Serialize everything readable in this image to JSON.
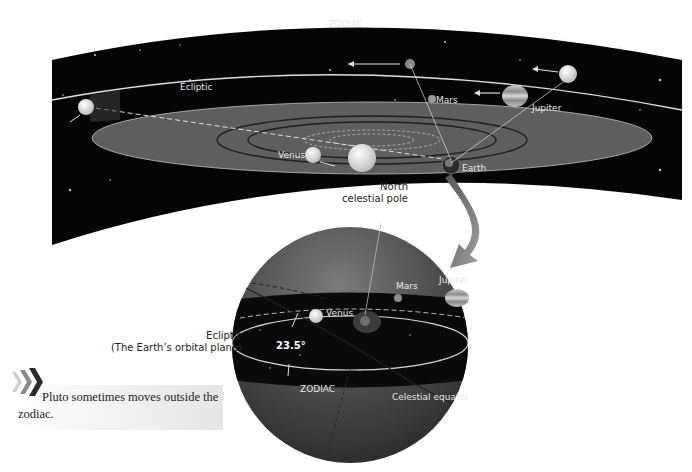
{
  "top_band": {
    "title": "ZODIAC",
    "ecliptic_label": "Ecliptic",
    "planets": {
      "mars": "Mars",
      "jupiter": "Jupiter",
      "venus": "Venus",
      "earth": "Earth"
    }
  },
  "pole_label": {
    "line1": "North",
    "line2": "celestial pole"
  },
  "sphere": {
    "mars": "Mars",
    "jupiter": "Jupiter",
    "venus": "Venus",
    "angle": "23.5°",
    "zodiac": "ZODIAC",
    "celestial_equator": "Celestial equator"
  },
  "ecliptic_label": {
    "line1": "Ecliptic",
    "line2": "(The Earth’s orbital plane)"
  },
  "note": {
    "text": "Pluto sometimes moves outside the zodiac."
  },
  "colors": {
    "sky": "#050505",
    "plane": "#5a5a5a",
    "sphere": "#4a4a4a",
    "arrow": "#7a7a7a",
    "label_light": "#e8e8e8"
  }
}
